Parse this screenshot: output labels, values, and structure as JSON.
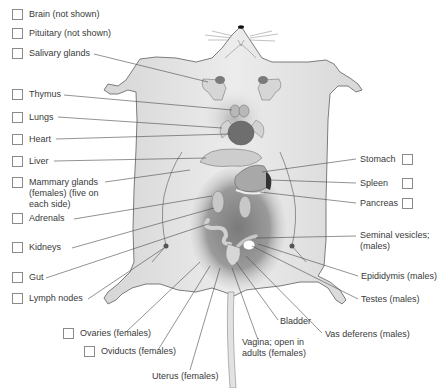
{
  "diagram": {
    "left_labels": [
      {
        "id": "brain",
        "text": "Brain (not shown)",
        "x": 12,
        "y": 9
      },
      {
        "id": "pituitary",
        "text": "Pituitary (not shown)",
        "x": 12,
        "y": 28
      },
      {
        "id": "salivary-glands",
        "text": "Salivary glands",
        "x": 12,
        "y": 48
      },
      {
        "id": "thymus",
        "text": "Thymus",
        "x": 12,
        "y": 89
      },
      {
        "id": "lungs",
        "text": "Lungs",
        "x": 12,
        "y": 112
      },
      {
        "id": "heart",
        "text": "Heart",
        "x": 12,
        "y": 134
      },
      {
        "id": "liver",
        "text": "Liver",
        "x": 12,
        "y": 156
      },
      {
        "id": "mammary-glands",
        "text": "Mammary glands\n(females) (five on\neach side)",
        "x": 12,
        "y": 177
      },
      {
        "id": "adrenals",
        "text": "Adrenals",
        "x": 12,
        "y": 213
      },
      {
        "id": "kidneys",
        "text": "Kidneys",
        "x": 12,
        "y": 242
      },
      {
        "id": "gut",
        "text": "Gut",
        "x": 12,
        "y": 272
      },
      {
        "id": "lymph-nodes",
        "text": "Lymph nodes",
        "x": 12,
        "y": 293
      },
      {
        "id": "ovaries",
        "text": "Ovaries (females)",
        "x": 63,
        "y": 328
      },
      {
        "id": "oviducts",
        "text": "Oviducts (females)",
        "x": 84,
        "y": 346
      }
    ],
    "right_labels": [
      {
        "id": "stomach",
        "text": "Stomach",
        "x": 360,
        "y": 154
      },
      {
        "id": "spleen",
        "text": "Spleen",
        "x": 360,
        "y": 178
      },
      {
        "id": "pancreas",
        "text": "Pancreas",
        "x": 360,
        "y": 198
      }
    ],
    "plain_labels": [
      {
        "id": "seminal-vesicles",
        "text": "Seminal vesicles;\n(males)",
        "x": 360,
        "y": 230
      },
      {
        "id": "epididymis",
        "text": "Epididymis (males)",
        "x": 361,
        "y": 271
      },
      {
        "id": "testes",
        "text": "Testes (males)",
        "x": 361,
        "y": 294
      },
      {
        "id": "bladder",
        "text": "Bladder",
        "x": 280,
        "y": 316
      },
      {
        "id": "vas-deferens",
        "text": "Vas deferens (males)",
        "x": 325,
        "y": 329
      },
      {
        "id": "vagina",
        "text": "Vagina; open in\nadults (females)",
        "x": 242,
        "y": 337
      },
      {
        "id": "uterus",
        "text": "Uterus (females)",
        "x": 152,
        "y": 371
      }
    ],
    "colors": {
      "skin": "#e6e6e6",
      "skin_outline": "#6e6e6e",
      "cavity": "#8a8a8a",
      "organ_light": "#cfcfcf",
      "organ_dark": "#6a6a6a",
      "leader_line": "#4a4a4a",
      "text": "#3a3a3a",
      "checkbox_border": "#8a8a8a"
    }
  }
}
